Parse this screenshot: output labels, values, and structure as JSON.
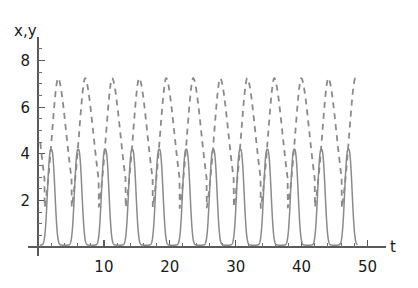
{
  "chart_data": {
    "type": "line",
    "title": "",
    "subtitle": "",
    "xlabel": "t",
    "ylabel": "x,y",
    "xlim": [
      0,
      52.5
    ],
    "ylim": [
      0,
      8.8
    ],
    "grid": false,
    "legend": "none",
    "x_ticks_major": [
      10,
      20,
      30,
      40,
      50
    ],
    "x_ticklabels": [
      "10",
      "20",
      "30",
      "40",
      "50"
    ],
    "x_ticks_minor": [
      2,
      4,
      6,
      8,
      12,
      14,
      16,
      18,
      22,
      24,
      26,
      28,
      32,
      34,
      36,
      38,
      42,
      44,
      46,
      48
    ],
    "y_ticks_major": [
      2,
      4,
      6,
      8
    ],
    "y_ticklabels": [
      "2",
      "4",
      "6",
      "8"
    ],
    "y_ticks_minor": [
      0.5,
      1,
      1.5,
      2.5,
      3,
      3.5,
      4.5,
      5,
      5.5,
      6.5,
      7,
      7.5,
      8.5
    ],
    "period": 4.1,
    "cycles_visible": 12,
    "series": [
      {
        "name": "x",
        "style": "solid",
        "color": "#8a8a8a",
        "peak_value": 4.2,
        "trough_value": 0.08,
        "first_peak_t": 2.0,
        "peak_width": 0.7,
        "description": "prey population, narrow sharp spikes"
      },
      {
        "name": "y",
        "style": "dashed",
        "color": "#8a8a8a",
        "peak_value": 7.25,
        "trough_value": 0.55,
        "first_peak_t": 3.05,
        "peak_width": 1.6,
        "description": "predator population, sawtooth peaks lagging prey"
      }
    ]
  },
  "axis": {
    "y_label": "x,y",
    "x_label": "t"
  }
}
